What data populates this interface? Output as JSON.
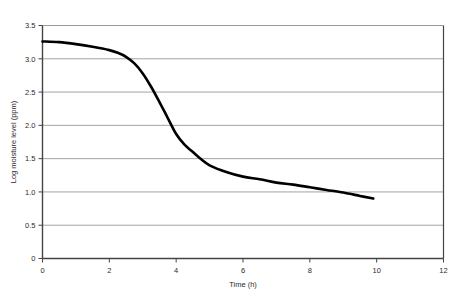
{
  "chart_data": {
    "type": "line",
    "title": "",
    "xlabel": "Time (h)",
    "ylabel": "Log moisture level (ppm)",
    "xlim": [
      0,
      12
    ],
    "ylim": [
      0,
      3.5
    ],
    "grid": "horizontal",
    "legend": "none",
    "xticks": [
      "0",
      "2",
      "4",
      "6",
      "8",
      "10",
      "12"
    ],
    "xtick_values": [
      0,
      2,
      4,
      6,
      8,
      10,
      12
    ],
    "yticks": [
      "0",
      "0.5",
      "1.0",
      "1.5",
      "2.0",
      "2.5",
      "3.0",
      "3.5"
    ],
    "ytick_values": [
      0,
      0.5,
      1.0,
      1.5,
      2.0,
      2.5,
      3.0,
      3.5
    ],
    "series": [
      {
        "name": "Log moisture level",
        "color": "#000000",
        "line_width": 2.6,
        "x": [
          0.0,
          0.5,
          1.0,
          1.5,
          2.0,
          2.25,
          2.5,
          2.75,
          3.0,
          3.25,
          3.5,
          3.75,
          4.0,
          4.25,
          4.5,
          4.75,
          5.0,
          5.5,
          6.0,
          6.5,
          7.0,
          7.5,
          8.0,
          8.5,
          9.0,
          9.5,
          9.9
        ],
        "y": [
          3.26,
          3.25,
          3.22,
          3.18,
          3.13,
          3.09,
          3.03,
          2.93,
          2.78,
          2.58,
          2.35,
          2.11,
          1.87,
          1.71,
          1.6,
          1.49,
          1.4,
          1.3,
          1.23,
          1.19,
          1.14,
          1.11,
          1.07,
          1.03,
          0.99,
          0.94,
          0.9
        ]
      }
    ]
  },
  "axes": {
    "x_label": "Time (h)",
    "y_label": "Log moisture level (ppm)"
  },
  "style": {
    "gridline_color": "#999999",
    "axis_color": "#444444",
    "curve_color": "#000000",
    "background": "#ffffff"
  }
}
